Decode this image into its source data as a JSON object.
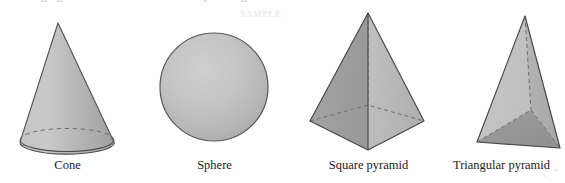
{
  "page": {
    "width": 565,
    "height": 183,
    "background": "#fefefe",
    "top_cutoff_text": "ding figures to find the volume of composite figures",
    "watermark_text": "SAMPLE"
  },
  "figures": [
    {
      "id": "cone",
      "name": "Cone",
      "caption": "Cone",
      "type": "cone",
      "geometry": {
        "apex": [
          58,
          23
        ],
        "base_center": [
          67,
          140
        ],
        "base_rx": 47,
        "base_ry": 11.5,
        "hidden_edge": "back-half-of-base-ellipse"
      },
      "colors": {
        "fill_light": "#cacaca",
        "fill_mid": "#b2b2b2",
        "fill_dark": "#969696",
        "outline": "#4f4f4f",
        "hidden_line": "#6d6d6d"
      }
    },
    {
      "id": "sphere",
      "name": "Sphere",
      "caption": "Sphere",
      "type": "sphere",
      "geometry": {
        "center": [
          214,
          87
        ],
        "radius": 54
      },
      "colors": {
        "fill_light": "#cbcbcb",
        "fill_mid": "#bdbdbd",
        "fill_dark": "#a6a6a6",
        "outline": "#585858"
      }
    },
    {
      "id": "square-pyramid",
      "name": "Square pyramid",
      "caption": "Square pyramid",
      "type": "square-pyramid",
      "geometry": {
        "apex": [
          368,
          13
        ],
        "base_left": [
          310,
          121
        ],
        "base_right": [
          424,
          121
        ],
        "base_front": [
          368,
          150
        ],
        "base_back_hidden": [
          368,
          105
        ],
        "hidden_edges": [
          "apex-to-back-vertex",
          "back-left-base-edge",
          "back-right-base-edge"
        ]
      },
      "colors": {
        "face_left": "#9d9d9d",
        "face_right": "#b9b9b9",
        "base_front": "#8e8e8e",
        "outline": "#4b4b4b",
        "hidden_line": "#6f6f6f"
      }
    },
    {
      "id": "triangular-pyramid",
      "name": "Triangular pyramid",
      "caption": "Triangular pyramid",
      "type": "triangular-pyramid",
      "geometry": {
        "apex": [
          525,
          16
        ],
        "base_left": [
          477,
          142
        ],
        "base_right": [
          560,
          148
        ],
        "base_back_hidden": [
          531,
          110
        ],
        "hidden_edges": [
          "apex-to-back-vertex",
          "back-left-base-edge",
          "back-right-base-edge"
        ]
      },
      "colors": {
        "face_left": "#c3c3c3",
        "face_right": "#b0b0b0",
        "base_front": "#979797",
        "outline": "#4b4b4b",
        "hidden_line": "#6f6f6f"
      }
    }
  ]
}
